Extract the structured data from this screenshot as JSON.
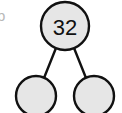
{
  "figure": {
    "background_color": "#ffffff"
  },
  "style": {
    "node_fill": "#e6e6e6",
    "node_stroke": "#111111",
    "node_stroke_width": 2.4,
    "edge_stroke": "#111111",
    "edge_stroke_width": 2.4,
    "label_color": "#111111",
    "margin_glyph_color": "#b8b8b8"
  },
  "margin": {
    "clipped_glyph": "b"
  },
  "tree": {
    "nodes": [
      {
        "id": "root",
        "label": "32",
        "has_label": true,
        "cx": 65,
        "cy": 26,
        "r": 24
      },
      {
        "id": "left-child",
        "label": "",
        "has_label": false,
        "cx": 36,
        "cy": 96,
        "r": 20
      },
      {
        "id": "right-child",
        "label": "",
        "has_label": false,
        "cx": 94,
        "cy": 96,
        "r": 20
      }
    ],
    "edges": [
      {
        "id": "root-to-left",
        "from": "root",
        "to": "left-child",
        "x1": 56,
        "y1": 48,
        "x2": 44,
        "y2": 78
      },
      {
        "id": "root-to-right",
        "from": "root",
        "to": "right-child",
        "x1": 74,
        "y1": 48,
        "x2": 86,
        "y2": 78
      }
    ]
  }
}
